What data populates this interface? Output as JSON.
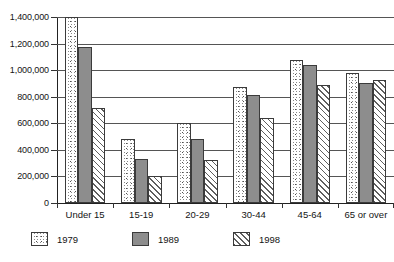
{
  "chart_data": {
    "type": "bar",
    "title": "",
    "subtitle": "",
    "xlabel": "",
    "ylabel": "",
    "categories": [
      "Under 15",
      "15-19",
      "20-29",
      "30-44",
      "45-64",
      "65 or over"
    ],
    "series": [
      {
        "name": "1979",
        "pattern": "stipple",
        "values": [
          1400000,
          485000,
          600000,
          870000,
          1080000,
          980000
        ]
      },
      {
        "name": "1989",
        "pattern": "solid-gray",
        "values": [
          1175000,
          335000,
          485000,
          810000,
          1040000,
          900000
        ]
      },
      {
        "name": "1998",
        "pattern": "diagonal-hatch",
        "values": [
          715000,
          205000,
          325000,
          640000,
          890000,
          925000
        ]
      }
    ],
    "ylim": [
      0,
      1400000
    ],
    "ytick_values": [
      0,
      200000,
      400000,
      600000,
      800000,
      1000000,
      1200000,
      1400000
    ],
    "ytick_labels": [
      "0",
      "200,000",
      "400,000",
      "600,000",
      "800,000",
      "1,000,000",
      "1,200,000",
      "1,400,000"
    ],
    "grid": "horizontal",
    "legend_position": "bottom-left",
    "colors": {
      "series_1979": "#ffffff",
      "series_1989": "#8d8d8d",
      "series_1998": "#ffffff",
      "outline": "#3b3b3b",
      "gridline": "#555555",
      "axis": "#222222",
      "text": "#141414",
      "background": "#ffffff"
    }
  },
  "legend": {
    "items": [
      {
        "label": "1979"
      },
      {
        "label": "1989"
      },
      {
        "label": "1998"
      }
    ]
  }
}
